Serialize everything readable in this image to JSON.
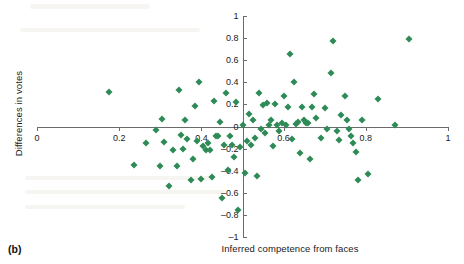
{
  "figure": {
    "panel_caption": "(b)",
    "marker_color": "#2e8b57",
    "axis_color": "#6b6b6b"
  },
  "chart_data": {
    "type": "scatter",
    "title": "",
    "xlabel": "Inferred competence from faces",
    "ylabel": "Differences in votes",
    "xlim": [
      0,
      1
    ],
    "ylim": [
      -1,
      1
    ],
    "xticks": [
      0,
      0.2,
      0.4,
      0.6,
      0.8,
      1
    ],
    "xticklabels": [
      "0",
      "0.2",
      "0.4",
      "0.6",
      "0.8",
      "1"
    ],
    "yticks": [
      -1,
      -0.8,
      -0.6,
      -0.4,
      -0.2,
      0,
      0.2,
      0.4,
      0.6,
      0.8,
      1
    ],
    "yticklabels": [
      "–1",
      "–0.8",
      "–0.6",
      "–0.4",
      "–0.2",
      "0",
      "0.2",
      "0.4",
      "0.6",
      "0.8",
      "1"
    ],
    "grid": false,
    "legend": null,
    "series": [
      {
        "name": "candidates",
        "marker": "diamond",
        "color": "#2e8b57",
        "points": [
          [
            0.175,
            0.315
          ],
          [
            0.235,
            -0.345
          ],
          [
            0.265,
            -0.15
          ],
          [
            0.29,
            -0.03
          ],
          [
            0.3,
            -0.355
          ],
          [
            0.305,
            0.07
          ],
          [
            0.31,
            -0.14
          ],
          [
            0.32,
            -0.54
          ],
          [
            0.33,
            -0.215
          ],
          [
            0.34,
            -0.355
          ],
          [
            0.345,
            0.33
          ],
          [
            0.35,
            -0.075
          ],
          [
            0.355,
            -0.205
          ],
          [
            0.36,
            0.055
          ],
          [
            0.365,
            -0.11
          ],
          [
            0.375,
            -0.48
          ],
          [
            0.38,
            -0.29
          ],
          [
            0.385,
            0.19
          ],
          [
            0.39,
            -0.13
          ],
          [
            0.395,
            0.4
          ],
          [
            0.4,
            -0.475
          ],
          [
            0.405,
            -0.18
          ],
          [
            0.41,
            -0.215
          ],
          [
            0.415,
            -0.15
          ],
          [
            0.42,
            -0.21
          ],
          [
            0.425,
            -0.455
          ],
          [
            0.43,
            0.235
          ],
          [
            0.435,
            -0.085
          ],
          [
            0.44,
            -0.085
          ],
          [
            0.445,
            0.04
          ],
          [
            0.45,
            -0.65
          ],
          [
            0.455,
            -0.165
          ],
          [
            0.46,
            0.3
          ],
          [
            0.465,
            -0.395
          ],
          [
            0.47,
            -0.09
          ],
          [
            0.475,
            -0.165
          ],
          [
            0.48,
            -0.275
          ],
          [
            0.485,
            0.225
          ],
          [
            0.49,
            -0.755
          ],
          [
            0.495,
            -0.185
          ],
          [
            0.5,
            0.015
          ],
          [
            0.505,
            -0.42
          ],
          [
            0.51,
            -0.135
          ],
          [
            0.515,
            0.11
          ],
          [
            0.52,
            -0.165
          ],
          [
            0.525,
            0.06
          ],
          [
            0.53,
            -0.105
          ],
          [
            0.535,
            -0.45
          ],
          [
            0.54,
            0.3
          ],
          [
            0.545,
            -0.025
          ],
          [
            0.55,
            0.195
          ],
          [
            0.555,
            -0.06
          ],
          [
            0.56,
            0.215
          ],
          [
            0.565,
            0.01
          ],
          [
            0.57,
            0.06
          ],
          [
            0.575,
            -0.175
          ],
          [
            0.58,
            0.2
          ],
          [
            0.585,
            0.01
          ],
          [
            0.59,
            -0.045
          ],
          [
            0.595,
            0.03
          ],
          [
            0.6,
            0.275
          ],
          [
            0.605,
            0.01
          ],
          [
            0.61,
            0.18
          ],
          [
            0.615,
            0.66
          ],
          [
            0.62,
            -0.11
          ],
          [
            0.625,
            0.4
          ],
          [
            0.63,
            0.02
          ],
          [
            0.635,
            0.045
          ],
          [
            0.64,
            -0.24
          ],
          [
            0.645,
            0.175
          ],
          [
            0.65,
            0.055
          ],
          [
            0.655,
            0.035
          ],
          [
            0.66,
            0.03
          ],
          [
            0.665,
            -0.29
          ],
          [
            0.67,
            0.18
          ],
          [
            0.675,
            0.295
          ],
          [
            0.68,
            0.08
          ],
          [
            0.69,
            -0.1
          ],
          [
            0.7,
            0.165
          ],
          [
            0.705,
            -0.025
          ],
          [
            0.715,
            0.485
          ],
          [
            0.72,
            0.775
          ],
          [
            0.73,
            -0.04
          ],
          [
            0.735,
            -0.12
          ],
          [
            0.74,
            0.1
          ],
          [
            0.75,
            0.28
          ],
          [
            0.755,
            0.055
          ],
          [
            0.76,
            -0.02
          ],
          [
            0.765,
            -0.09
          ],
          [
            0.77,
            -0.15
          ],
          [
            0.775,
            -0.23
          ],
          [
            0.78,
            -0.48
          ],
          [
            0.79,
            0.06
          ],
          [
            0.805,
            -0.43
          ],
          [
            0.83,
            0.25
          ],
          [
            0.87,
            0.01
          ],
          [
            0.905,
            0.79
          ]
        ]
      }
    ]
  }
}
